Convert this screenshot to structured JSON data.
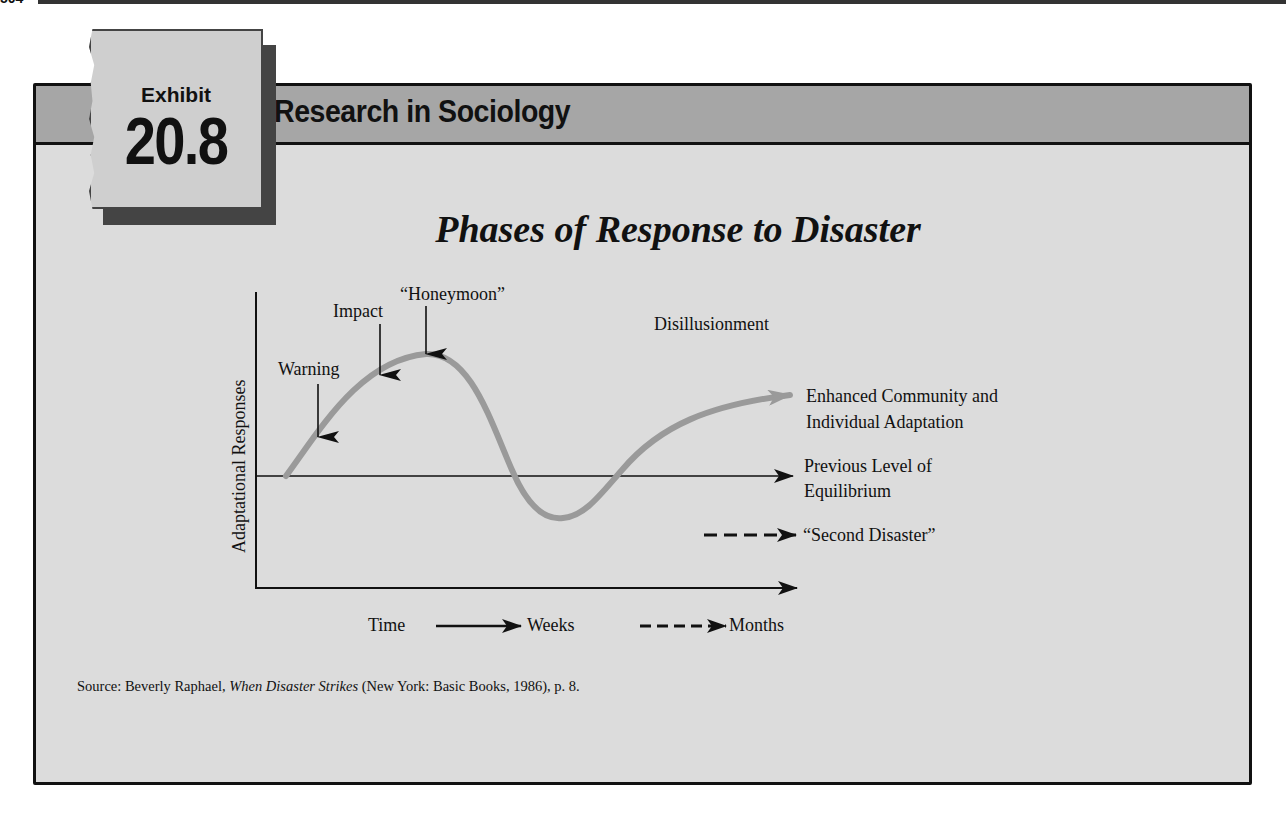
{
  "page": {
    "page_number": "504"
  },
  "header": {
    "section_title": "Research in Sociology",
    "exhibit_label": "Exhibit",
    "exhibit_number": "20.8"
  },
  "diagram": {
    "title": "Phases of Response to Disaster",
    "y_axis_label": "Adaptational Responses",
    "phase_labels": {
      "warning": "Warning",
      "impact": "Impact",
      "honeymoon": "“Honeymoon”",
      "disillusionment": "Disillusionment"
    },
    "outcome_labels": {
      "enhanced_line1": "Enhanced Community and",
      "enhanced_line2": "Individual Adaptation",
      "previous_line1": "Previous Level of",
      "previous_line2": "Equilibrium",
      "second_disaster": "“Second Disaster”"
    },
    "time_legend": {
      "time": "Time",
      "weeks": "Weeks",
      "months": "Months"
    },
    "colors": {
      "curve": "#9a9a9a",
      "axis": "#111111",
      "panel": "#dcdcdc",
      "band": "#a6a6a6"
    }
  },
  "source": {
    "prefix": "Source: Beverly Raphael, ",
    "book_title": "When Disaster Strikes",
    "suffix": " (New York: Basic Books, 1986), p. 8."
  }
}
